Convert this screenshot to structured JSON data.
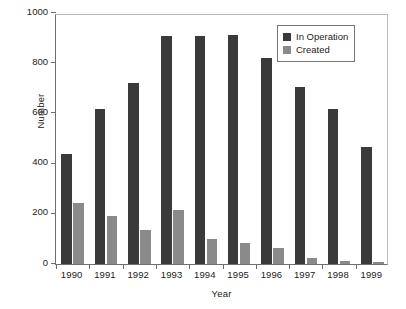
{
  "chart_data": {
    "type": "bar",
    "title": "",
    "xlabel": "Year",
    "ylabel": "Number",
    "categories": [
      "1990",
      "1991",
      "1992",
      "1993",
      "1994",
      "1995",
      "1996",
      "1997",
      "1998",
      "1999"
    ],
    "series": [
      {
        "name": "In Operation",
        "color": "#3a3a3a",
        "values": [
          440,
          617,
          720,
          910,
          910,
          913,
          822,
          705,
          618,
          465
        ]
      },
      {
        "name": "Created",
        "color": "#8a8a8a",
        "values": [
          243,
          190,
          135,
          215,
          100,
          85,
          65,
          25,
          13,
          8
        ]
      }
    ],
    "ylim": [
      0,
      1000
    ],
    "yticks": [
      0,
      200,
      400,
      600,
      800,
      1000
    ],
    "ytick_labels": [
      "0",
      "200",
      "400",
      "600",
      "800",
      "1000"
    ],
    "grid": false,
    "legend_position": "top-right"
  }
}
